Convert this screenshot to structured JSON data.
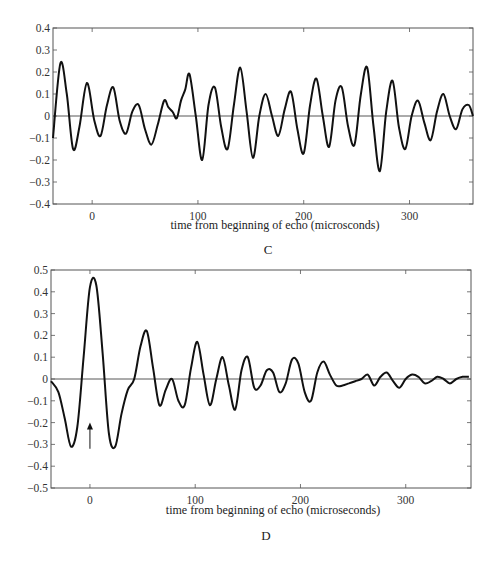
{
  "chart_data": [
    {
      "panel": "C",
      "type": "line",
      "xlabel": "time from beginning of echo (microsconds)",
      "ylabel": "",
      "caption": "C",
      "xlim": [
        -37,
        360
      ],
      "ylim": [
        -0.4,
        0.4
      ],
      "xticks": [
        0,
        100,
        200,
        300
      ],
      "yticks": [
        0.4,
        0.3,
        0.2,
        0.1,
        0,
        -0.1,
        -0.2,
        -0.3,
        -0.4
      ],
      "ytick_labels": [
        "0.4",
        "0.3",
        "0.2",
        "0.1",
        "0",
        "-0.1",
        "-0.2",
        "-0.3",
        "-0.4"
      ],
      "zero_line": true,
      "series": [
        {
          "name": "echo waveform",
          "x": [
            -37,
            -30,
            -24,
            -18,
            -12,
            -5,
            2,
            8,
            14,
            20,
            26,
            32,
            38,
            44,
            50,
            56,
            62,
            68,
            72,
            76,
            80,
            84,
            88,
            92,
            98,
            104,
            110,
            116,
            122,
            128,
            134,
            140,
            146,
            152,
            158,
            164,
            170,
            176,
            182,
            188,
            194,
            200,
            206,
            212,
            218,
            224,
            230,
            236,
            242,
            248,
            254,
            260,
            266,
            272,
            278,
            284,
            290,
            296,
            302,
            308,
            314,
            320,
            326,
            332,
            338,
            344,
            350,
            356,
            360
          ],
          "y": [
            -0.1,
            0.24,
            0.1,
            -0.15,
            -0.05,
            0.15,
            -0.02,
            -0.09,
            0.05,
            0.13,
            -0.02,
            -0.08,
            0.02,
            0.05,
            -0.06,
            -0.13,
            -0.04,
            0.07,
            0.04,
            0.02,
            -0.01,
            0.07,
            0.12,
            0.19,
            0.0,
            -0.2,
            0.05,
            0.13,
            -0.05,
            -0.15,
            0.05,
            0.22,
            0.02,
            -0.19,
            0.0,
            0.1,
            0.0,
            -0.09,
            0.03,
            0.11,
            -0.06,
            -0.17,
            0.05,
            0.17,
            0.0,
            -0.14,
            0.07,
            0.13,
            -0.05,
            -0.13,
            0.1,
            0.22,
            -0.05,
            -0.25,
            0.02,
            0.16,
            -0.05,
            -0.15,
            0.0,
            0.07,
            -0.03,
            -0.11,
            0.02,
            0.1,
            0.0,
            -0.06,
            0.03,
            0.05,
            0.0
          ]
        }
      ]
    },
    {
      "panel": "D",
      "type": "line",
      "xlabel": "time from beginning of echo (microseconds)",
      "ylabel": "",
      "caption": "D",
      "xlim": [
        -37,
        362
      ],
      "ylim": [
        -0.5,
        0.5
      ],
      "xticks": [
        0,
        100,
        200,
        300
      ],
      "yticks": [
        0.5,
        0.4,
        0.3,
        0.2,
        0.1,
        0,
        -0.1,
        -0.2,
        -0.3,
        -0.4,
        -0.5
      ],
      "ytick_labels": [
        "0.5",
        "0.4",
        "0.3",
        "0.2",
        "0.1",
        "0",
        "-0.1",
        "-0.2",
        "-0.3",
        "-0.4",
        "-0.5"
      ],
      "zero_line": true,
      "annotation": {
        "type": "arrow",
        "x": 0,
        "y_from": -0.32,
        "y_to": -0.2
      },
      "series": [
        {
          "name": "echo waveform",
          "x": [
            -37,
            -30,
            -24,
            -18,
            -12,
            -6,
            0,
            6,
            12,
            18,
            24,
            30,
            36,
            42,
            48,
            54,
            60,
            66,
            72,
            78,
            84,
            90,
            96,
            102,
            108,
            114,
            120,
            126,
            132,
            138,
            144,
            150,
            156,
            162,
            168,
            174,
            180,
            186,
            192,
            198,
            204,
            210,
            216,
            222,
            228,
            234,
            240,
            246,
            252,
            258,
            264,
            270,
            276,
            282,
            288,
            294,
            300,
            306,
            312,
            318,
            324,
            330,
            336,
            342,
            348,
            354,
            360
          ],
          "y": [
            -0.01,
            -0.06,
            -0.18,
            -0.31,
            -0.22,
            0.1,
            0.42,
            0.43,
            0.12,
            -0.25,
            -0.31,
            -0.16,
            -0.05,
            0.0,
            0.15,
            0.22,
            0.05,
            -0.12,
            -0.05,
            0.0,
            -0.1,
            -0.12,
            0.05,
            0.17,
            0.02,
            -0.12,
            0.0,
            0.1,
            -0.03,
            -0.14,
            0.04,
            0.1,
            -0.04,
            -0.03,
            0.04,
            0.03,
            -0.06,
            -0.02,
            0.09,
            0.07,
            -0.06,
            -0.1,
            0.03,
            0.08,
            0.02,
            -0.03,
            -0.03,
            -0.02,
            -0.01,
            0.0,
            0.02,
            -0.03,
            0.01,
            0.03,
            -0.01,
            -0.04,
            0.0,
            0.02,
            0.01,
            -0.02,
            -0.01,
            0.01,
            0.0,
            -0.02,
            0.0,
            0.01,
            0.01
          ]
        }
      ]
    }
  ]
}
